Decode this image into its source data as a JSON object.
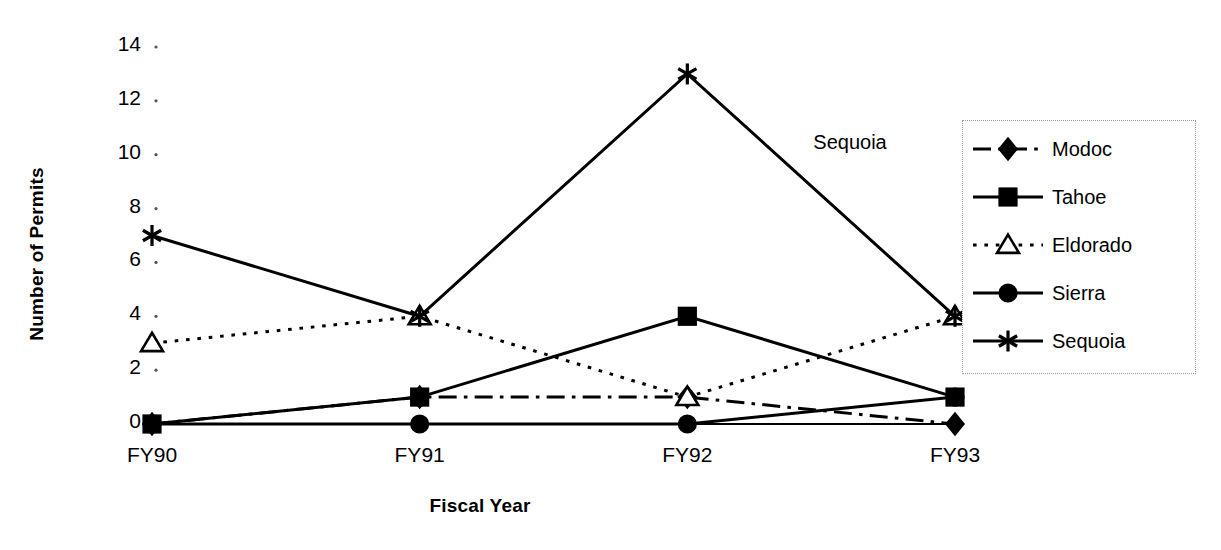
{
  "chart_data": {
    "type": "line",
    "title": "",
    "xlabel": "Fiscal Year",
    "ylabel": "Number of Permits",
    "categories": [
      "FY90",
      "FY91",
      "FY92",
      "FY93"
    ],
    "yticks": [
      0,
      2,
      4,
      6,
      8,
      10,
      12,
      14
    ],
    "ylim": [
      0,
      14
    ],
    "grid": false,
    "legend_position": "right",
    "annotations": [
      {
        "text": "Sequoia",
        "x_category": "FY92",
        "y_value": 10.4
      }
    ],
    "series": [
      {
        "name": "Modoc",
        "values": [
          0,
          1,
          1,
          0
        ],
        "line_style": "dash-dot",
        "marker": "diamond",
        "marker_fill": "solid",
        "color": "#000000"
      },
      {
        "name": "Tahoe",
        "values": [
          0,
          1,
          4,
          1
        ],
        "line_style": "solid",
        "marker": "square",
        "marker_fill": "solid",
        "color": "#000000"
      },
      {
        "name": "Eldorado",
        "values": [
          3,
          4,
          1,
          4
        ],
        "line_style": "dotted",
        "marker": "triangle",
        "marker_fill": "open",
        "color": "#000000"
      },
      {
        "name": "Sierra",
        "values": [
          0,
          0,
          0,
          1
        ],
        "line_style": "solid",
        "marker": "circle",
        "marker_fill": "solid",
        "color": "#000000"
      },
      {
        "name": "Sequoia",
        "values": [
          7,
          4,
          13,
          4
        ],
        "line_style": "solid",
        "marker": "asterisk",
        "marker_fill": "solid",
        "color": "#000000"
      }
    ]
  },
  "legend": {
    "items": [
      {
        "label": "Modoc"
      },
      {
        "label": "Tahoe"
      },
      {
        "label": "Eldorado"
      },
      {
        "label": "Sierra"
      },
      {
        "label": "Sequoia"
      }
    ]
  }
}
